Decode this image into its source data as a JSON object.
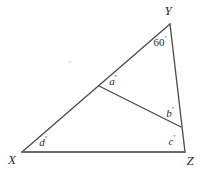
{
  "figure": {
    "type": "geometry-diagram",
    "shape": "triangle-with-cevian",
    "background_color": "#ffffff",
    "stroke_color": "#4a4a4a",
    "base_stroke_color": "#6a6a6a",
    "text_color": "#2b2b2b",
    "canvas": {
      "width": 207,
      "height": 174
    },
    "vertices": [
      {
        "id": "Y",
        "label": "Y",
        "x": 170,
        "y": 24,
        "label_x": 168,
        "label_y": 10
      },
      {
        "id": "X",
        "label": "X",
        "x": 22,
        "y": 152,
        "label_x": 12,
        "label_y": 159
      },
      {
        "id": "Z",
        "label": "Z",
        "x": 185,
        "y": 152,
        "label_x": 190,
        "label_y": 160
      }
    ],
    "cevian_points": [
      {
        "id": "P",
        "on_segment": "XY",
        "x": 99,
        "y": 86
      },
      {
        "id": "Q",
        "on_segment": "YZ",
        "x": 181,
        "y": 127
      }
    ],
    "segments": [
      {
        "id": "XY",
        "from": "X",
        "to": "Y"
      },
      {
        "id": "YZ",
        "from": "Y",
        "to": "Z"
      },
      {
        "id": "XZ",
        "from": "X",
        "to": "Z",
        "emphasis": "base"
      },
      {
        "id": "PQ",
        "from": "P",
        "to": "Q",
        "role": "cevian"
      }
    ],
    "angle_labels": [
      {
        "id": "angle-y",
        "text": "60",
        "degree": "º",
        "numeric": true,
        "value": 60,
        "at_vertex": "Y",
        "x": 160,
        "y": 42
      },
      {
        "id": "angle-a",
        "text": "a",
        "degree": "º",
        "numeric": false,
        "at_vertex": "P",
        "x": 113,
        "y": 81
      },
      {
        "id": "angle-b",
        "text": "b",
        "degree": "º",
        "numeric": false,
        "at_vertex": "Q",
        "x": 170,
        "y": 113
      },
      {
        "id": "angle-c",
        "text": "c",
        "degree": "º",
        "numeric": false,
        "at_vertex": "Z",
        "x": 172,
        "y": 141
      },
      {
        "id": "angle-d",
        "text": "d",
        "degree": "º",
        "numeric": false,
        "at_vertex": "X",
        "x": 43,
        "y": 142
      }
    ],
    "artifacts": [
      {
        "id": "scan-speck",
        "x": 70,
        "y": 62
      }
    ]
  }
}
